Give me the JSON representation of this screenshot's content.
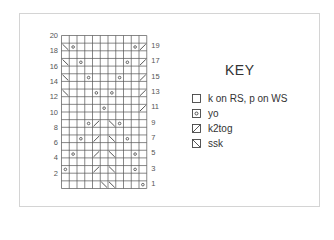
{
  "chart": {
    "columns": 11,
    "rows": 20,
    "left_labels": [
      "20",
      "18",
      "16",
      "14",
      "12",
      "10",
      "8",
      "6",
      "4",
      "2"
    ],
    "right_labels": [
      "19",
      "17",
      "15",
      "13",
      "11",
      "9",
      "7",
      "5",
      "3",
      "1"
    ],
    "symbols": [
      {
        "row": 19,
        "col": 1,
        "type": "ssk"
      },
      {
        "row": 19,
        "col": 2,
        "type": "yo"
      },
      {
        "row": 19,
        "col": 10,
        "type": "yo"
      },
      {
        "row": 19,
        "col": 11,
        "type": "k2tog"
      },
      {
        "row": 17,
        "col": 1,
        "type": "ssk"
      },
      {
        "row": 17,
        "col": 3,
        "type": "yo"
      },
      {
        "row": 17,
        "col": 9,
        "type": "yo"
      },
      {
        "row": 17,
        "col": 11,
        "type": "k2tog"
      },
      {
        "row": 15,
        "col": 1,
        "type": "ssk"
      },
      {
        "row": 15,
        "col": 4,
        "type": "yo"
      },
      {
        "row": 15,
        "col": 8,
        "type": "yo"
      },
      {
        "row": 15,
        "col": 11,
        "type": "k2tog"
      },
      {
        "row": 13,
        "col": 1,
        "type": "ssk"
      },
      {
        "row": 13,
        "col": 5,
        "type": "yo"
      },
      {
        "row": 13,
        "col": 7,
        "type": "yo"
      },
      {
        "row": 13,
        "col": 11,
        "type": "k2tog"
      },
      {
        "row": 11,
        "col": 6,
        "type": "yo"
      },
      {
        "row": 11,
        "col": 11,
        "type": "k2tog"
      },
      {
        "row": 9,
        "col": 4,
        "type": "yo"
      },
      {
        "row": 9,
        "col": 5,
        "type": "k2tog"
      },
      {
        "row": 9,
        "col": 7,
        "type": "ssk"
      },
      {
        "row": 9,
        "col": 8,
        "type": "yo"
      },
      {
        "row": 7,
        "col": 3,
        "type": "yo"
      },
      {
        "row": 7,
        "col": 5,
        "type": "k2tog"
      },
      {
        "row": 7,
        "col": 7,
        "type": "ssk"
      },
      {
        "row": 7,
        "col": 9,
        "type": "yo"
      },
      {
        "row": 5,
        "col": 2,
        "type": "yo"
      },
      {
        "row": 5,
        "col": 5,
        "type": "k2tog"
      },
      {
        "row": 5,
        "col": 7,
        "type": "ssk"
      },
      {
        "row": 5,
        "col": 10,
        "type": "yo"
      },
      {
        "row": 3,
        "col": 1,
        "type": "yo"
      },
      {
        "row": 3,
        "col": 5,
        "type": "k2tog"
      },
      {
        "row": 3,
        "col": 7,
        "type": "ssk"
      },
      {
        "row": 3,
        "col": 10,
        "type": "yo"
      },
      {
        "row": 1,
        "col": 6,
        "type": "ssk"
      },
      {
        "row": 1,
        "col": 7,
        "type": "ssk"
      },
      {
        "row": 1,
        "col": 11,
        "type": "yo"
      }
    ]
  },
  "key": {
    "title": "KEY",
    "items": [
      {
        "symbol": "knit",
        "label": "k on RS, p on WS"
      },
      {
        "symbol": "yo",
        "label": "yo"
      },
      {
        "symbol": "k2tog",
        "label": "k2tog"
      },
      {
        "symbol": "ssk",
        "label": "ssk"
      }
    ]
  },
  "colors": {
    "grid": "#555555",
    "symbol": "#444444",
    "frame": "#d4d4d4"
  }
}
